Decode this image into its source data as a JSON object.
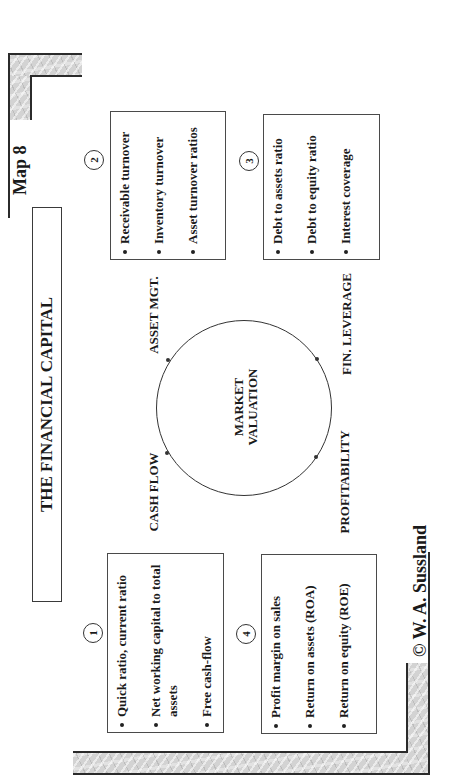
{
  "header": {
    "map_label": "Map 8",
    "title": "THE FINANCIAL CAPITAL"
  },
  "center": {
    "line1": "MARKET",
    "line2": "VALUATION"
  },
  "axis_labels": {
    "asset_mgt": "ASSET MGT.",
    "fin_leverage": "FIN. LEVERAGE",
    "cash_flow": "CASH FLOW",
    "profitability": "PROFITABILITY"
  },
  "boxes": [
    {
      "number": "1",
      "items": [
        "Quick ratio, current ratio",
        "Net working capital to total assets",
        "Free cash-flow"
      ]
    },
    {
      "number": "2",
      "items": [
        "Receivable turnover",
        "Inventory turnover",
        "Asset turnover ratios"
      ]
    },
    {
      "number": "3",
      "items": [
        "Debt to assets ratio",
        "Debt to equity ratio",
        "Interest coverage"
      ]
    },
    {
      "number": "4",
      "items": [
        "Profit margin on sales",
        "Return on assets (ROA)",
        "Return on equity (ROE)"
      ]
    }
  ],
  "footer": {
    "copyright": "© W. A. Sussland"
  },
  "style": {
    "line_color": "#2b2b2b",
    "marble_color": "#d3d3d3",
    "text_color": "#1a1a1a",
    "background": "#ffffff"
  }
}
